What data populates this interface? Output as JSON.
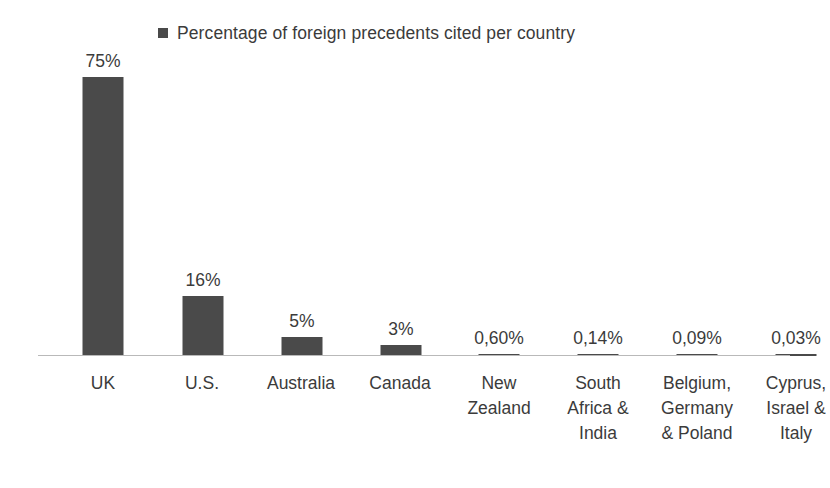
{
  "legend": {
    "marker_color": "#4a4a4a",
    "label": "Percentage of foreign precedents cited per country"
  },
  "axis": {
    "line_color": "#b9b9b9"
  },
  "chart_data": {
    "type": "bar",
    "title": "",
    "subtitle": "",
    "xlabel": "",
    "ylabel": "",
    "ylim": [
      0,
      80
    ],
    "grid": false,
    "legend_position": "top",
    "series_name": "Percentage of foreign precedents cited per country",
    "bar_color": "#4a4a4a",
    "categories": [
      "UK",
      "U.S.",
      "Australia",
      "Canada",
      "New Zealand",
      "South Africa & India",
      "Belgium, Germany & Poland",
      "Cyprus, Israel & Italy"
    ],
    "category_lines": [
      [
        "UK"
      ],
      [
        "U.S."
      ],
      [
        "Australia"
      ],
      [
        "Canada"
      ],
      [
        "New",
        "Zealand"
      ],
      [
        "South",
        "Africa &",
        "India"
      ],
      [
        "Belgium,",
        "Germany",
        "& Poland"
      ],
      [
        "Cyprus,",
        "Israel &",
        "Italy"
      ]
    ],
    "values": [
      75,
      16,
      5,
      3,
      0.6,
      0.14,
      0.09,
      0.03
    ],
    "data_labels": [
      "75%",
      "16%",
      "5%",
      "3%",
      "0,60%",
      "0,14%",
      "0,09%",
      "0,03%"
    ]
  },
  "bars": [
    {
      "label": "75%",
      "cat0": "UK",
      "cat1": "",
      "cat2": ""
    },
    {
      "label": "16%",
      "cat0": "U.S.",
      "cat1": "",
      "cat2": ""
    },
    {
      "label": "5%",
      "cat0": "Australia",
      "cat1": "",
      "cat2": ""
    },
    {
      "label": "3%",
      "cat0": "Canada",
      "cat1": "",
      "cat2": ""
    },
    {
      "label": "0,60%",
      "cat0": "New",
      "cat1": "Zealand",
      "cat2": ""
    },
    {
      "label": "0,14%",
      "cat0": "South",
      "cat1": "Africa &",
      "cat2": "India"
    },
    {
      "label": "0,09%",
      "cat0": "Belgium,",
      "cat1": "Germany",
      "cat2": "& Poland"
    },
    {
      "label": "0,03%",
      "cat0": "Cyprus,",
      "cat1": "Israel &",
      "cat2": "Italy"
    }
  ]
}
